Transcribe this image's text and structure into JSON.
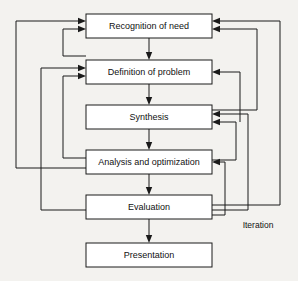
{
  "diagram": {
    "type": "flowchart",
    "orientation": "vertical-top-to-bottom",
    "background_color": "#f3f2ef",
    "line_color": "#1a1a1a",
    "box_fill_color": "#ffffff",
    "nodes": [
      {
        "id": "recognition",
        "label": "Recognition of need",
        "x": 86,
        "y": 14,
        "w": 126,
        "h": 24
      },
      {
        "id": "definition",
        "label": "Definition of problem",
        "x": 86,
        "y": 60,
        "w": 126,
        "h": 24
      },
      {
        "id": "synthesis",
        "label": "Synthesis",
        "x": 86,
        "y": 105,
        "w": 126,
        "h": 24
      },
      {
        "id": "analysis",
        "label": "Analysis and optimization",
        "x": 86,
        "y": 150,
        "w": 126,
        "h": 24
      },
      {
        "id": "evaluation",
        "label": "Evaluation",
        "x": 86,
        "y": 195,
        "w": 126,
        "h": 24
      },
      {
        "id": "presentation",
        "label": "Presentation",
        "x": 86,
        "y": 243,
        "w": 126,
        "h": 24
      }
    ],
    "forward_edges": [
      {
        "from": "recognition",
        "to": "definition"
      },
      {
        "from": "definition",
        "to": "synthesis"
      },
      {
        "from": "synthesis",
        "to": "analysis"
      },
      {
        "from": "analysis",
        "to": "evaluation"
      },
      {
        "from": "evaluation",
        "to": "presentation"
      }
    ],
    "feedback_edges": [
      {
        "from": "analysis",
        "to": "recognition",
        "side": "left",
        "channel": 16
      },
      {
        "from": "evaluation",
        "to": "recognition",
        "side": "right",
        "channel": 280
      },
      {
        "from": "evaluation",
        "to": "definition",
        "side": "left",
        "channel": 41
      },
      {
        "from": "evaluation",
        "to": "synthesis",
        "side": "right",
        "channel": 257
      },
      {
        "from": "analysis",
        "to": "definition",
        "side": "left",
        "channel": 63
      },
      {
        "from": "synthesis",
        "to": "recognition",
        "side": "right",
        "channel": 257
      },
      {
        "from": "synthesis",
        "to": "definition",
        "side": "right",
        "channel": 240
      },
      {
        "from": "evaluation",
        "to": "analysis",
        "side": "right",
        "channel": 225
      }
    ],
    "annotations": [
      {
        "id": "iteration",
        "label": "Iteration",
        "x": 258,
        "y": 225
      }
    ]
  }
}
